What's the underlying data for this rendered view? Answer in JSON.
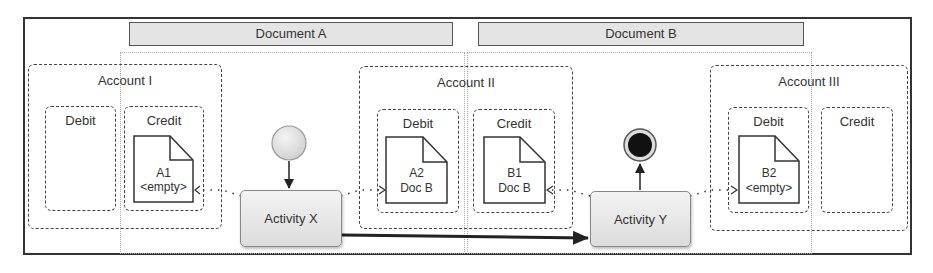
{
  "documents": [
    {
      "label": "Document A"
    },
    {
      "label": "Document B"
    }
  ],
  "accounts": [
    {
      "label": "Account I",
      "slots": [
        {
          "label": "Debit"
        },
        {
          "label": "Credit",
          "data_object": {
            "line1": "A1",
            "line2": "<empty>"
          }
        }
      ]
    },
    {
      "label": "Account II",
      "slots": [
        {
          "label": "Debit",
          "data_object": {
            "line1": "A2",
            "line2": "Doc B"
          }
        },
        {
          "label": "Credit",
          "data_object": {
            "line1": "B1",
            "line2": "Doc B"
          }
        }
      ]
    },
    {
      "label": "Account III",
      "slots": [
        {
          "label": "Debit",
          "data_object": {
            "line1": "B2",
            "line2": "<empty>"
          }
        },
        {
          "label": "Credit"
        }
      ]
    }
  ],
  "activities": [
    {
      "label": "Activity X"
    },
    {
      "label": "Activity Y"
    }
  ],
  "events": {
    "start": "start-event",
    "end": "end-event"
  },
  "colors": {
    "frame": "#333333",
    "header_bg": "#e4e4e4",
    "activity_bg": "#e6e6e6",
    "start_fill": "#e8e8e8",
    "end_fill": "#111111"
  }
}
